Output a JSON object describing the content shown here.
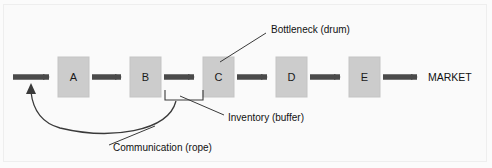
{
  "diagram": {
    "colors": {
      "background": "#fafafa",
      "box_fill": "#cccccc",
      "box_stroke": "#c2c2c2",
      "arrow": "#4a4a4a",
      "line": "#3a3a3a",
      "text": "#111111"
    },
    "stations": [
      {
        "id": "a",
        "label": "A",
        "x": 58,
        "y": 57,
        "w": 31,
        "h": 40
      },
      {
        "id": "b",
        "label": "B",
        "x": 130,
        "y": 57,
        "w": 31,
        "h": 40
      },
      {
        "id": "c",
        "label": "C",
        "x": 203,
        "y": 57,
        "w": 31,
        "h": 40
      },
      {
        "id": "d",
        "label": "D",
        "x": 276,
        "y": 57,
        "w": 31,
        "h": 40
      },
      {
        "id": "e",
        "label": "E",
        "x": 349,
        "y": 57,
        "w": 31,
        "h": 40
      }
    ],
    "flow_arrows": [
      {
        "id": "input",
        "x1": 13,
        "x2": 55,
        "y": 77
      },
      {
        "id": "a-to-b",
        "x1": 92,
        "x2": 127,
        "y": 77
      },
      {
        "id": "b-to-c",
        "x1": 164,
        "x2": 200,
        "y": 77
      },
      {
        "id": "c-to-d",
        "x1": 237,
        "x2": 273,
        "y": 77
      },
      {
        "id": "d-to-e",
        "x1": 310,
        "x2": 346,
        "y": 77
      },
      {
        "id": "e-to-market",
        "x1": 383,
        "x2": 423,
        "y": 77
      }
    ],
    "market": {
      "label": "MARKET",
      "x": 428,
      "y": 78
    },
    "annotations": [
      {
        "id": "bottleneck",
        "label": "Bottleneck (drum)",
        "text_x": 271,
        "text_y": 30,
        "leader": "M 266 33 L 220 62"
      },
      {
        "id": "inventory",
        "label": "Inventory (buffer)",
        "text_x": 228,
        "text_y": 118,
        "leader": "M 224 115 L 178 96"
      },
      {
        "id": "communication",
        "label": "Communication (rope)",
        "text_x": 113,
        "text_y": 148,
        "leader": "M 109 145 L 155 126"
      }
    ],
    "buffer_bracket": {
      "id": "buffer-bracket",
      "path": "M 165 90 L 165 100 L 203 100 L 203 90"
    },
    "rope": {
      "id": "rope-curve",
      "path": "M 176 101 C 168 132, 110 140, 60 128 C 42 123, 33 110, 31 92",
      "arrowhead": "M 31 84 L 26.5 94 L 35.5 94 Z"
    }
  }
}
